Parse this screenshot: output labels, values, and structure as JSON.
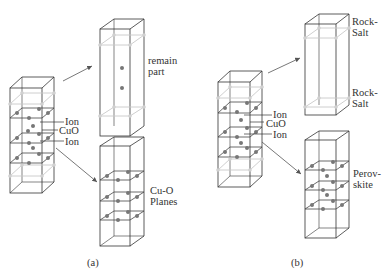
{
  "panels": [
    {
      "caption": "(a)",
      "source_labels": [
        "Ion",
        "CuO",
        "Ion"
      ],
      "upper_box_label": [
        "remain",
        "part"
      ],
      "lower_box_label": [
        "Cu-O",
        "Planes"
      ]
    },
    {
      "caption": "(b)",
      "source_labels": [
        "Ion",
        "CuO",
        "Ion"
      ],
      "upper_box_label_top": [
        "Rock-",
        "Salt"
      ],
      "upper_box_label_bottom": [
        "Rock-",
        "Salt"
      ],
      "lower_box_label": [
        "Perov-",
        "skite"
      ]
    }
  ],
  "colors": {
    "line": "#333333",
    "gray_plane": "#c8c8c8",
    "atom_dark": "#777777",
    "atom_light": "#d0d0d0"
  }
}
